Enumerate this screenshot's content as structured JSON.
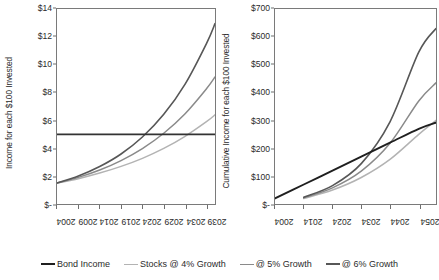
{
  "chart_data": [
    {
      "panel": "left",
      "type": "line",
      "title": "",
      "xlabel": "",
      "ylabel": "Income for each $100 Invested",
      "xlim": [
        2004,
        2041
      ],
      "ylim": [
        0,
        14
      ],
      "xticks": [
        "2004",
        "2009",
        "2014",
        "2019",
        "2024",
        "2029",
        "2034",
        "2039"
      ],
      "xtick_values": [
        2004,
        2009,
        2014,
        2019,
        2024,
        2029,
        2034,
        2039
      ],
      "yticks": [
        "$-",
        "$2",
        "$4",
        "$6",
        "$8",
        "$10",
        "$12",
        "$14"
      ],
      "ytick_values": [
        0,
        2,
        4,
        6,
        8,
        10,
        12,
        14
      ],
      "grid": false,
      "legend_position": "bottom",
      "x": [
        2004,
        2009,
        2014,
        2019,
        2024,
        2029,
        2034,
        2039,
        2041
      ],
      "series": [
        {
          "name": "Bond Income",
          "color": "#333333",
          "width": 1.9,
          "values": [
            5.0,
            5.0,
            5.0,
            5.0,
            5.0,
            5.0,
            5.0,
            5.0,
            5.0
          ]
        },
        {
          "name": "Stocks @ 4% Growth",
          "color": "#b3b3b3",
          "width": 1.5,
          "values": [
            1.5,
            1.82,
            2.22,
            2.7,
            3.28,
            3.99,
            4.86,
            5.91,
            6.4
          ]
        },
        {
          "name": "@ 5% Growth",
          "color": "#8a8a8a",
          "width": 1.5,
          "values": [
            1.5,
            1.91,
            2.44,
            3.12,
            3.98,
            5.08,
            6.48,
            8.27,
            9.12
          ]
        },
        {
          "name": "@ 6% Growth",
          "color": "#575757",
          "width": 1.6,
          "values": [
            1.5,
            2.01,
            2.69,
            3.59,
            4.81,
            6.44,
            8.61,
            11.52,
            12.95
          ]
        }
      ]
    },
    {
      "panel": "right",
      "type": "line",
      "title": "",
      "xlabel": "",
      "ylabel": "Cumulative Income for each $100 Invested",
      "xlim": [
        2004,
        2060
      ],
      "ylim": [
        0,
        700
      ],
      "xticks": [
        "2004",
        "2014",
        "2024",
        "2034",
        "2044",
        "2054"
      ],
      "xtick_values": [
        2004,
        2014,
        2024,
        2034,
        2044,
        2054
      ],
      "yticks": [
        "$-",
        "$100",
        "$200",
        "$300",
        "$400",
        "$500",
        "$600",
        "$700"
      ],
      "ytick_values": [
        0,
        100,
        200,
        300,
        400,
        500,
        600,
        700
      ],
      "grid": false,
      "legend_position": "bottom",
      "x": [
        2004,
        2014,
        2024,
        2034,
        2044,
        2054,
        2060
      ],
      "series": [
        {
          "name": "Bond Income",
          "color": "#1f1f1f",
          "width": 1.9,
          "values": [
            20,
            70,
            120,
            170,
            220,
            270,
            292
          ]
        },
        {
          "name": "Stocks @ 4% Growth",
          "color": "#b3b3b3",
          "width": 1.5,
          "values": [
            0,
            20,
            50,
            95,
            160,
            250,
            300
          ]
        },
        {
          "name": "@ 5% Growth",
          "color": "#8a8a8a",
          "width": 1.5,
          "values": [
            0,
            22,
            58,
            118,
            218,
            370,
            435
          ]
        },
        {
          "name": "@ 6% Growth",
          "color": "#575757",
          "width": 1.6,
          "values": [
            0,
            24,
            66,
            145,
            295,
            545,
            630
          ]
        }
      ]
    }
  ],
  "legend": {
    "items": [
      {
        "label": "Bond Income",
        "color": "#1f1f1f",
        "width": 2.4
      },
      {
        "label": "Stocks @ 4% Growth",
        "color": "#b3b3b3",
        "width": 1.6
      },
      {
        "label": "@ 5% Growth",
        "color": "#8a8a8a",
        "width": 1.6
      },
      {
        "label": "@ 6% Growth",
        "color": "#575757",
        "width": 2.0
      }
    ]
  },
  "colors": {
    "axis": "#7a7a7a",
    "text": "#2b2b2b",
    "background": "#ffffff"
  }
}
